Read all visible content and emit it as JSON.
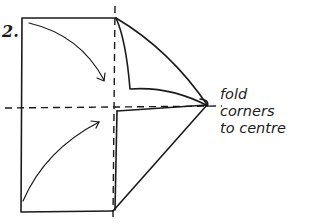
{
  "diagram": {
    "step_number": "2.",
    "instruction": {
      "line1": "fold",
      "line2": "corners",
      "line3": "to centre"
    },
    "colors": {
      "stroke": "#1a1a1a",
      "background": "#ffffff"
    }
  }
}
